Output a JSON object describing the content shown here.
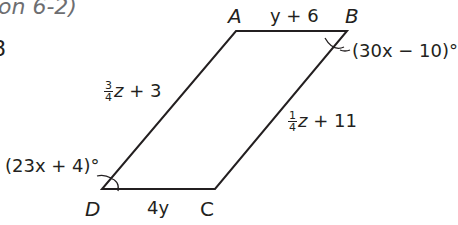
{
  "header": {
    "lesson_ref": "on 6-2)",
    "problem_number_fragment": "8"
  },
  "diagram": {
    "shape": "parallelogram",
    "vertices": {
      "A": {
        "label": "A",
        "x": 236,
        "y": 31
      },
      "B": {
        "label": "B",
        "x": 347,
        "y": 31
      },
      "C": {
        "label": "C",
        "x": 215,
        "y": 189
      },
      "D": {
        "label": "D",
        "x": 102,
        "y": 189
      }
    },
    "sides": {
      "AB": {
        "expr": "y + 6"
      },
      "DC": {
        "expr": "4y"
      },
      "AD": {
        "coef_num": "3",
        "coef_den": "4",
        "var": "z",
        "rest": " + 3"
      },
      "BC": {
        "coef_num": "1",
        "coef_den": "4",
        "var": "z",
        "rest": " + 11"
      }
    },
    "angles": {
      "B": {
        "expr": "(30x − 10)°"
      },
      "D": {
        "expr": "(23x + 4)°"
      }
    },
    "stroke_color": "#231f20"
  }
}
